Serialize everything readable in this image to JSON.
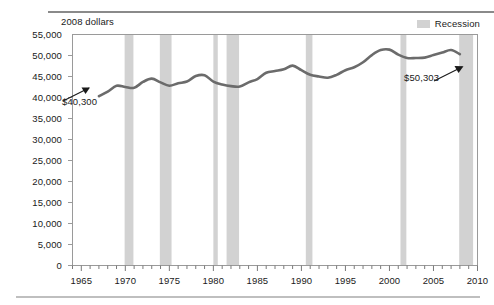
{
  "chart_data": {
    "type": "line",
    "title": "",
    "ylabel": "2008 dollars",
    "xlabel": "",
    "ylim": [
      0,
      55000
    ],
    "xlim": [
      1964,
      2010
    ],
    "grid": false,
    "legend_position": "top-right",
    "y_ticks": [
      "0",
      "5,000",
      "10,000",
      "15,000",
      "20,000",
      "25,000",
      "30,000",
      "35,000",
      "40,000",
      "45,000",
      "50,000",
      "55,000"
    ],
    "y_tick_values": [
      0,
      5000,
      10000,
      15000,
      20000,
      25000,
      30000,
      35000,
      40000,
      45000,
      50000,
      55000
    ],
    "x_ticks": [
      "1965",
      "1970",
      "1975",
      "1980",
      "1985",
      "1990",
      "1995",
      "2000",
      "2005",
      "2010"
    ],
    "x_tick_values": [
      1965,
      1970,
      1975,
      1980,
      1985,
      1990,
      1995,
      2000,
      2005,
      2010
    ],
    "x_minor_tick_interval": 1,
    "series": [
      {
        "name": "Median household income",
        "color": "#6b6b6b",
        "x": [
          1967,
          1968,
          1969,
          1970,
          1971,
          1972,
          1973,
          1974,
          1975,
          1976,
          1977,
          1978,
          1979,
          1980,
          1981,
          1982,
          1983,
          1984,
          1985,
          1986,
          1987,
          1988,
          1989,
          1990,
          1991,
          1992,
          1993,
          1994,
          1995,
          1996,
          1997,
          1998,
          1999,
          2000,
          2001,
          2002,
          2003,
          2004,
          2005,
          2006,
          2007,
          2008
        ],
        "values": [
          40300,
          41400,
          42800,
          42500,
          42300,
          43700,
          44500,
          43600,
          42800,
          43400,
          43800,
          45100,
          45300,
          43800,
          43100,
          42700,
          42600,
          43600,
          44400,
          45900,
          46300,
          46700,
          47600,
          46500,
          45400,
          45000,
          44700,
          45400,
          46500,
          47200,
          48400,
          50100,
          51300,
          51400,
          50200,
          49400,
          49400,
          49500,
          50100,
          50700,
          51300,
          50303
        ]
      }
    ],
    "recessions": [
      {
        "start": 1969.92,
        "end": 1970.92
      },
      {
        "start": 1973.92,
        "end": 1975.25
      },
      {
        "start": 1980.0,
        "end": 1980.5
      },
      {
        "start": 1981.5,
        "end": 1982.92
      },
      {
        "start": 1990.5,
        "end": 1991.25
      },
      {
        "start": 2001.25,
        "end": 2001.92
      },
      {
        "start": 2007.92,
        "end": 2009.5
      }
    ],
    "annotations": [
      {
        "name": "start-value",
        "text": "$40,300",
        "year": 1967,
        "value": 40300
      },
      {
        "name": "end-value",
        "text": "$50,303",
        "year": 2008,
        "value": 50303
      }
    ]
  },
  "legend": {
    "items": [
      {
        "label": "Recession",
        "color": "#d2d2d2"
      }
    ]
  },
  "axis": {
    "y_title": "2008 dollars"
  }
}
